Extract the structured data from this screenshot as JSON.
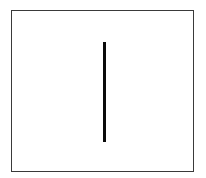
{
  "figure": {
    "background_color": "#ffffff",
    "canvas": {
      "width": 206,
      "height": 178
    },
    "frame": {
      "name": "rectangle-border",
      "stroke_color": "#3a3a3a",
      "fill_color": "#ffffff",
      "stroke_width": 1,
      "x": 11,
      "y": 10,
      "width": 183,
      "height": 162
    },
    "line": {
      "name": "vertical-line-segment",
      "color": "#0a0a0a",
      "thickness": 3,
      "x_center": 104.5,
      "y_top": 42,
      "y_bottom": 142,
      "length": 100,
      "orientation": "vertical"
    }
  }
}
